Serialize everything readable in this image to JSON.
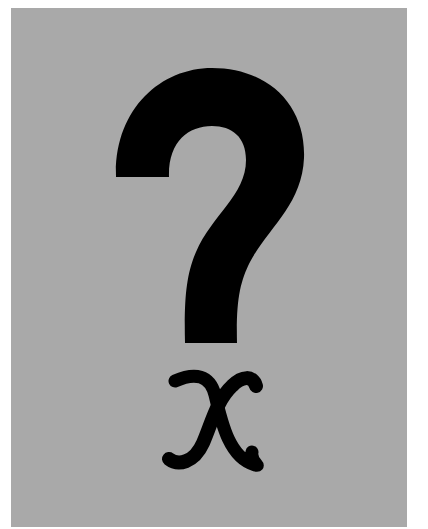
{
  "image": {
    "subject": "question mark above a variable x",
    "symbols": [
      {
        "name": "question-mark",
        "glyph": "?"
      },
      {
        "name": "variable-x",
        "glyph": "x"
      }
    ],
    "colors": {
      "background": "#ffffff",
      "panel": "#a9a9a9",
      "ink": "#000000"
    }
  }
}
